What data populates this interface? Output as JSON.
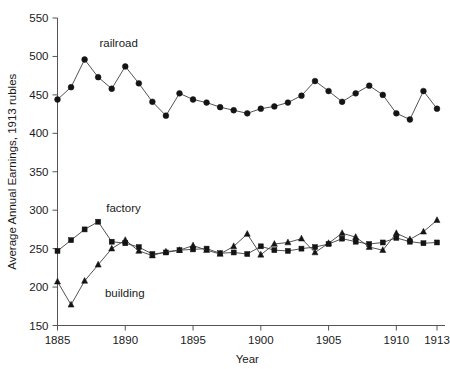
{
  "chart_data": {
    "type": "line",
    "title": "",
    "xlabel": "Year",
    "ylabel": "Average Annual Earnings, 1913 rubles",
    "xlim": [
      1885,
      1913
    ],
    "ylim": [
      150,
      550
    ],
    "grid": false,
    "legend_position": "inline-annotations",
    "x_ticks": [
      1885,
      1890,
      1895,
      1900,
      1905,
      1910,
      1913
    ],
    "x_tick_labels": [
      "1885",
      "1890",
      "1895",
      "1900",
      "1905",
      "1910",
      "1913"
    ],
    "y_ticks": [
      150,
      200,
      250,
      300,
      350,
      400,
      450,
      500,
      550
    ],
    "y_tick_labels": [
      "150",
      "200",
      "250",
      "300",
      "350",
      "400",
      "450",
      "500",
      "550"
    ],
    "x": [
      1885,
      1886,
      1887,
      1888,
      1889,
      1890,
      1891,
      1892,
      1893,
      1894,
      1895,
      1896,
      1897,
      1898,
      1899,
      1900,
      1901,
      1902,
      1903,
      1904,
      1905,
      1906,
      1907,
      1908,
      1909,
      1910,
      1911,
      1912,
      1913
    ],
    "series": [
      {
        "name": "railroad",
        "marker": "circle",
        "label_x": 1888.1,
        "label_y": 512,
        "values": [
          444,
          460,
          496,
          473,
          458,
          487,
          465,
          441,
          423,
          452,
          444,
          440,
          434,
          430,
          426,
          432,
          435,
          440,
          449,
          468,
          455,
          441,
          452,
          462,
          450,
          426,
          418,
          455,
          432
        ]
      },
      {
        "name": "factory",
        "marker": "square",
        "label_x": 1888.6,
        "label_y": 297,
        "values": [
          247,
          261,
          275,
          285,
          259,
          257,
          252,
          243,
          245,
          248,
          249,
          250,
          244,
          245,
          243,
          253,
          248,
          247,
          250,
          252,
          256,
          263,
          259,
          256,
          258,
          264,
          259,
          257,
          258
        ]
      },
      {
        "name": "building",
        "marker": "triangle",
        "label_x": 1888.5,
        "label_y": 187,
        "values": [
          207,
          177,
          208,
          229,
          250,
          261,
          247,
          241,
          246,
          248,
          254,
          248,
          243,
          253,
          269,
          242,
          256,
          258,
          263,
          245,
          257,
          270,
          265,
          252,
          248,
          270,
          262,
          272,
          287
        ]
      }
    ],
    "annotations": [
      {
        "text": "railroad",
        "series": "railroad"
      },
      {
        "text": "factory",
        "series": "factory"
      },
      {
        "text": "building",
        "series": "building"
      }
    ],
    "colors": {
      "line": "#404040",
      "marker": "#141414",
      "axis": "#555555",
      "text": "#1a1a1a",
      "background": "#ffffff"
    }
  }
}
